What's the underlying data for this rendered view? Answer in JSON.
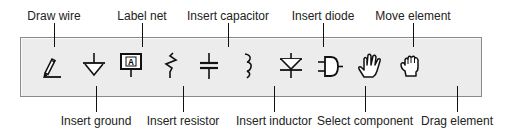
{
  "toolbar": {
    "tools": [
      {
        "id": "draw-wire",
        "label": "Draw wire",
        "icon": "pencil-wire-icon",
        "label_position": "top"
      },
      {
        "id": "insert-ground",
        "label": "Insert ground",
        "icon": "ground-icon",
        "label_position": "bottom"
      },
      {
        "id": "label-net",
        "label": "Label net",
        "icon": "net-label-icon",
        "label_position": "top",
        "glyph": "A"
      },
      {
        "id": "insert-resistor",
        "label": "Insert resistor",
        "icon": "resistor-icon",
        "label_position": "bottom"
      },
      {
        "id": "insert-capacitor",
        "label": "Insert capacitor",
        "icon": "capacitor-icon",
        "label_position": "top"
      },
      {
        "id": "insert-inductor",
        "label": "Insert inductor",
        "icon": "inductor-icon",
        "label_position": "bottom"
      },
      {
        "id": "insert-diode",
        "label": "Insert diode",
        "icon": "diode-icon",
        "label_position": "top"
      },
      {
        "id": "select-component",
        "label": "Select component",
        "icon": "and-gate-icon",
        "label_position": "bottom"
      },
      {
        "id": "move-element",
        "label": "Move element",
        "icon": "open-hand-icon",
        "label_position": "top"
      },
      {
        "id": "drag-element",
        "label": "Drag element",
        "icon": "grab-hand-icon",
        "label_position": "bottom"
      }
    ]
  },
  "colors": {
    "toolbar_bg": "#ececec",
    "toolbar_border": "#8a8a8a",
    "icon_stroke": "#111111",
    "label_text": "#222222"
  }
}
